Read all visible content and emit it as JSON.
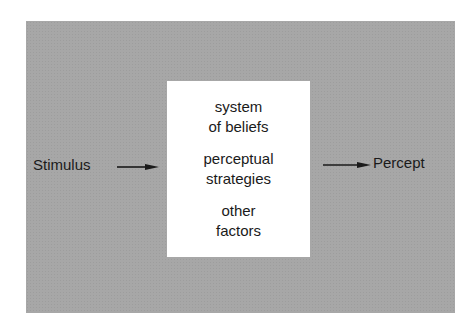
{
  "diagram": {
    "input_label": "Stimulus",
    "output_label": "Percept",
    "process_box": {
      "groups": [
        {
          "lines": [
            "system",
            "of beliefs"
          ]
        },
        {
          "lines": [
            "perceptual",
            "strategies"
          ]
        },
        {
          "lines": [
            "other",
            "factors"
          ]
        }
      ]
    },
    "colors": {
      "background_panel": "#a7a7a7",
      "process_box": "#ffffff",
      "text": "#1a1a1a"
    }
  }
}
